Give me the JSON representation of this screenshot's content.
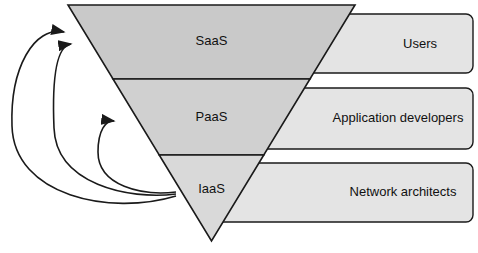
{
  "diagram": {
    "type": "inverted-pyramid-cloud-service-models",
    "pyramid": {
      "name": "cloud-service-model-pyramid",
      "orientation": "inverted",
      "layers": [
        {
          "id": "saas",
          "label": "SaaS",
          "fill": "#c9c9c9",
          "order": 1
        },
        {
          "id": "paas",
          "label": "PaaS",
          "fill": "#d0d0d0",
          "order": 2
        },
        {
          "id": "iaas",
          "label": "IaaS",
          "fill": "#d9d9d9",
          "order": 3
        }
      ]
    },
    "audience_boxes": [
      {
        "id": "users",
        "label": "Users",
        "fill": "#e4e4e4",
        "maps_to": "saas"
      },
      {
        "id": "application-developers",
        "label": "Application developers",
        "fill": "#e4e4e4",
        "maps_to": "paas"
      },
      {
        "id": "network-architects",
        "label": "Network architects",
        "fill": "#e4e4e4",
        "maps_to": "iaas"
      }
    ],
    "arrows": [
      {
        "id": "iaas-to-saas-outer",
        "from": "iaas",
        "to": "saas",
        "style": "curved"
      },
      {
        "id": "iaas-to-saas-inner",
        "from": "iaas",
        "to": "saas",
        "style": "curved"
      },
      {
        "id": "iaas-to-paas",
        "from": "iaas",
        "to": "paas",
        "style": "curved"
      }
    ],
    "colors": {
      "stroke": "#1a1a1a",
      "background": "#ffffff",
      "box_fill": "#e4e4e4",
      "saas_fill": "#c9c9c9",
      "paas_fill": "#d0d0d0",
      "iaas_fill": "#d9d9d9"
    }
  }
}
